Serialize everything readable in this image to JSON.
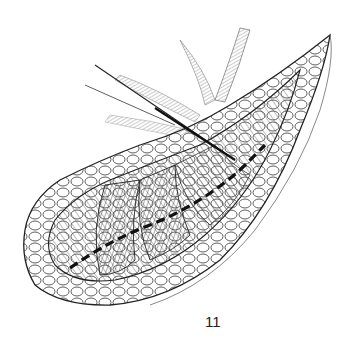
{
  "figure": {
    "type": "surgical-illustration",
    "style": "pen-and-ink line drawing",
    "label": "11",
    "colors": {
      "ink": "#1a1a1a",
      "background": "#ffffff"
    },
    "elements": [
      "incision-with-fat-margins",
      "exposed-muscle-fibers",
      "dashed-incision-line",
      "retracted-tissue-flaps",
      "instrument"
    ]
  }
}
